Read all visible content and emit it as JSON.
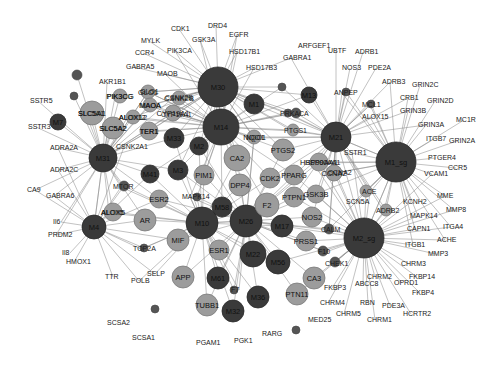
{
  "colors": {
    "module": "#3a3a3a",
    "hub": "#9c9c9c",
    "small": "#555555",
    "edge": "#8a8a8a",
    "background": "#ffffff"
  },
  "nodes": [
    {
      "id": "M30",
      "type": "module",
      "x": 218,
      "y": 87,
      "r": 20
    },
    {
      "id": "M14",
      "type": "module",
      "x": 221,
      "y": 127,
      "r": 18
    },
    {
      "id": "M1",
      "type": "module",
      "x": 254,
      "y": 104,
      "r": 10
    },
    {
      "id": "M13",
      "type": "module",
      "x": 309,
      "y": 95,
      "r": 8
    },
    {
      "id": "M21",
      "type": "module",
      "x": 336,
      "y": 137,
      "r": 15
    },
    {
      "id": "M1_sg",
      "type": "module",
      "x": 396,
      "y": 162,
      "r": 20
    },
    {
      "id": "M2_sg",
      "type": "module",
      "x": 364,
      "y": 238,
      "r": 20
    },
    {
      "id": "M31",
      "type": "module",
      "x": 103,
      "y": 158,
      "r": 14
    },
    {
      "id": "M33",
      "type": "module",
      "x": 174,
      "y": 138,
      "r": 10
    },
    {
      "id": "M2",
      "type": "module",
      "x": 199,
      "y": 146,
      "r": 9
    },
    {
      "id": "M3",
      "type": "module",
      "x": 178,
      "y": 170,
      "r": 10
    },
    {
      "id": "M41",
      "type": "module",
      "x": 150,
      "y": 174,
      "r": 9
    },
    {
      "id": "M10",
      "type": "module",
      "x": 202,
      "y": 223,
      "r": 16
    },
    {
      "id": "M26",
      "type": "module",
      "x": 246,
      "y": 221,
      "r": 16
    },
    {
      "id": "M58",
      "type": "module",
      "x": 222,
      "y": 207,
      "r": 10
    },
    {
      "id": "M17",
      "type": "module",
      "x": 282,
      "y": 226,
      "r": 11
    },
    {
      "id": "M22",
      "type": "module",
      "x": 253,
      "y": 254,
      "r": 13
    },
    {
      "id": "M56",
      "type": "module",
      "x": 278,
      "y": 262,
      "r": 12
    },
    {
      "id": "M61",
      "type": "module",
      "x": 218,
      "y": 278,
      "r": 11
    },
    {
      "id": "M36",
      "type": "module",
      "x": 258,
      "y": 297,
      "r": 11
    },
    {
      "id": "M32",
      "type": "module",
      "x": 233,
      "y": 311,
      "r": 11
    },
    {
      "id": "M4",
      "type": "module",
      "x": 94,
      "y": 227,
      "r": 12
    },
    {
      "id": "M7",
      "type": "module",
      "x": 58,
      "y": 122,
      "r": 8
    },
    {
      "id": "CA2",
      "type": "hub",
      "x": 237,
      "y": 158,
      "r": 13
    },
    {
      "id": "SLC5A1",
      "type": "hub",
      "x": 92,
      "y": 113,
      "r": 12
    },
    {
      "id": "SLC5A2",
      "type": "hub",
      "x": 113,
      "y": 128,
      "r": 11
    },
    {
      "id": "TER1",
      "type": "hub",
      "x": 149,
      "y": 131,
      "r": 9
    },
    {
      "id": "GLO1",
      "type": "hub",
      "x": 148,
      "y": 92,
      "r": 7
    },
    {
      "id": "CSNK2B",
      "type": "hub",
      "x": 179,
      "y": 98,
      "r": 7
    },
    {
      "id": "MAOA",
      "type": "hub",
      "x": 150,
      "y": 105,
      "r": 7
    },
    {
      "id": "CYP19A1",
      "type": "hub",
      "x": 173,
      "y": 113,
      "r": 8
    },
    {
      "id": "ALOX12",
      "type": "hub",
      "x": 133,
      "y": 117,
      "r": 7
    },
    {
      "id": "PIK3CG",
      "type": "hub",
      "x": 120,
      "y": 96,
      "r": 7
    },
    {
      "id": "PIM1",
      "type": "hub",
      "x": 204,
      "y": 175,
      "r": 10
    },
    {
      "id": "DPP4",
      "type": "hub",
      "x": 240,
      "y": 185,
      "r": 11
    },
    {
      "id": "CDK2",
      "type": "hub",
      "x": 270,
      "y": 178,
      "r": 10
    },
    {
      "id": "F2",
      "type": "hub",
      "x": 267,
      "y": 205,
      "r": 12
    },
    {
      "id": "PTGS2",
      "type": "hub",
      "x": 283,
      "y": 150,
      "r": 11
    },
    {
      "id": "PPARG",
      "type": "hub",
      "x": 294,
      "y": 175,
      "r": 10
    },
    {
      "id": "PTPN1",
      "type": "hub",
      "x": 294,
      "y": 197,
      "r": 10
    },
    {
      "id": "GSK3B",
      "type": "hub",
      "x": 316,
      "y": 194,
      "r": 9
    },
    {
      "id": "NOS2",
      "type": "hub",
      "x": 312,
      "y": 217,
      "r": 10
    },
    {
      "id": "PRSS1",
      "type": "hub",
      "x": 306,
      "y": 241,
      "r": 10
    },
    {
      "id": "CA3",
      "type": "hub",
      "x": 314,
      "y": 278,
      "r": 11
    },
    {
      "id": "PTN11",
      "type": "hub",
      "x": 297,
      "y": 294,
      "r": 11
    },
    {
      "id": "ESR1",
      "type": "hub",
      "x": 219,
      "y": 250,
      "r": 10
    },
    {
      "id": "ESR2",
      "type": "hub",
      "x": 159,
      "y": 199,
      "r": 9
    },
    {
      "id": "AR",
      "type": "hub",
      "x": 145,
      "y": 220,
      "r": 11
    },
    {
      "id": "MIF",
      "type": "hub",
      "x": 178,
      "y": 240,
      "r": 11
    },
    {
      "id": "APP",
      "type": "hub",
      "x": 183,
      "y": 277,
      "r": 11
    },
    {
      "id": "TUBB1",
      "type": "hub",
      "x": 207,
      "y": 305,
      "r": 11
    },
    {
      "id": "ALOX5",
      "type": "hub",
      "x": 113,
      "y": 212,
      "r": 9
    },
    {
      "id": "HSP90AA1",
      "type": "hub",
      "x": 319,
      "y": 162,
      "r": 9
    },
    {
      "id": "CCNA2",
      "type": "hub",
      "x": 334,
      "y": 173,
      "r": 8
    },
    {
      "id": "NQO1",
      "type": "hub",
      "x": 254,
      "y": 137,
      "r": 7
    },
    {
      "id": "PTGS1",
      "type": "hub",
      "x": 293,
      "y": 130,
      "r": 6
    },
    {
      "id": "ACE",
      "type": "hub",
      "x": 366,
      "y": 191,
      "r": 6
    },
    {
      "id": "ADRB2",
      "type": "hub",
      "x": 386,
      "y": 210,
      "r": 6
    },
    {
      "id": "CALM",
      "type": "small",
      "x": 329,
      "y": 229,
      "r": 5
    },
    {
      "id": "F10",
      "type": "small",
      "x": 323,
      "y": 251,
      "r": 5
    },
    {
      "id": "F7",
      "type": "small",
      "x": 234,
      "y": 290,
      "r": 4
    },
    {
      "id": "MTOR",
      "type": "small",
      "x": 124,
      "y": 186,
      "r": 5
    },
    {
      "id": "MAPK14",
      "type": "small",
      "x": 197,
      "y": 197,
      "r": 4
    },
    {
      "id": "TOP2A",
      "type": "small",
      "x": 144,
      "y": 248,
      "r": 4
    },
    {
      "id": "CHEK1",
      "type": "small",
      "x": 335,
      "y": 262,
      "r": 5
    },
    {
      "id": "PRKACA",
      "type": "small",
      "x": 296,
      "y": 113,
      "r": 5
    },
    {
      "id": "ANPEP",
      "type": "small",
      "x": 346,
      "y": 92,
      "r": 4
    },
    {
      "id": "MCL1",
      "type": "small",
      "x": 371,
      "y": 104,
      "r": 4
    },
    {
      "id": "M6",
      "type": "small",
      "x": 77,
      "y": 75,
      "r": 5
    },
    {
      "id": "M9",
      "type": "small",
      "x": 74,
      "y": 96,
      "r": 4
    },
    {
      "id": "M50",
      "type": "small",
      "x": 155,
      "y": 309,
      "r": 4
    },
    {
      "id": "M5_sg",
      "type": "small",
      "x": 282,
      "y": 87,
      "r": 4
    },
    {
      "id": "M8_sg",
      "type": "small",
      "x": 296,
      "y": 330,
      "r": 4
    },
    {
      "id": "M34",
      "type": "small",
      "x": 288,
      "y": 113,
      "r": 4
    }
  ],
  "labels": [
    {
      "text": "CDK1",
      "x": 171,
      "y": 31
    },
    {
      "text": "DRD4",
      "x": 208,
      "y": 28
    },
    {
      "text": "EGFR",
      "x": 229,
      "y": 37
    },
    {
      "text": "MYLK",
      "x": 141,
      "y": 43
    },
    {
      "text": "GSK3A",
      "x": 192,
      "y": 42
    },
    {
      "text": "HSD17B1",
      "x": 229,
      "y": 54
    },
    {
      "text": "CCR4",
      "x": 135,
      "y": 55
    },
    {
      "text": "PIK3CA",
      "x": 167,
      "y": 53
    },
    {
      "text": "HSD17B3",
      "x": 246,
      "y": 70
    },
    {
      "text": "GABRA5",
      "x": 126,
      "y": 69
    },
    {
      "text": "MAOB",
      "x": 157,
      "y": 76
    },
    {
      "text": "AKR1B1",
      "x": 99,
      "y": 84
    },
    {
      "text": "PIK3CG",
      "x": 107,
      "y": 99
    },
    {
      "text": "GLO1",
      "x": 140,
      "y": 94
    },
    {
      "text": "CSNK2B",
      "x": 165,
      "y": 100
    },
    {
      "text": "MAOA",
      "x": 140,
      "y": 108
    },
    {
      "text": "CYP19A1",
      "x": 161,
      "y": 117
    },
    {
      "text": "ALOX12",
      "x": 119,
      "y": 120
    },
    {
      "text": "SLC5A1",
      "x": 78,
      "y": 116
    },
    {
      "text": "SLC5A2",
      "x": 100,
      "y": 131
    },
    {
      "text": "TER1",
      "x": 140,
      "y": 134
    },
    {
      "text": "SSTR5",
      "x": 30,
      "y": 103
    },
    {
      "text": "SSTR3",
      "x": 28,
      "y": 129
    },
    {
      "text": "ADRA2A",
      "x": 50,
      "y": 150
    },
    {
      "text": "CSNK2A1",
      "x": 116,
      "y": 149
    },
    {
      "text": "ADRA2C",
      "x": 50,
      "y": 172
    },
    {
      "text": "CA9",
      "x": 27,
      "y": 192
    },
    {
      "text": "GABRA6",
      "x": 46,
      "y": 198
    },
    {
      "text": "MTOR",
      "x": 113,
      "y": 189
    },
    {
      "text": "ALOX5",
      "x": 101,
      "y": 215
    },
    {
      "text": "Il6",
      "x": 53,
      "y": 224
    },
    {
      "text": "PRDM2",
      "x": 48,
      "y": 237
    },
    {
      "text": "Il8",
      "x": 62,
      "y": 255
    },
    {
      "text": "HMOX1",
      "x": 66,
      "y": 264
    },
    {
      "text": "MAPK14",
      "x": 182,
      "y": 199
    },
    {
      "text": "TOP2A",
      "x": 133,
      "y": 251
    },
    {
      "text": "TTR",
      "x": 105,
      "y": 279
    },
    {
      "text": "POLB",
      "x": 131,
      "y": 283
    },
    {
      "text": "SELP",
      "x": 147,
      "y": 276
    },
    {
      "text": "SCSA2",
      "x": 107,
      "y": 325
    },
    {
      "text": "SCSA1",
      "x": 132,
      "y": 340
    },
    {
      "text": "PGAM1",
      "x": 196,
      "y": 345
    },
    {
      "text": "PGK1",
      "x": 234,
      "y": 343
    },
    {
      "text": "RARG",
      "x": 262,
      "y": 336
    },
    {
      "text": "MED25",
      "x": 308,
      "y": 322
    },
    {
      "text": "CHRM4",
      "x": 320,
      "y": 305
    },
    {
      "text": "CHRM5",
      "x": 336,
      "y": 316
    },
    {
      "text": "RBN",
      "x": 360,
      "y": 305
    },
    {
      "text": "PDE3A",
      "x": 382,
      "y": 308
    },
    {
      "text": "CHRM1",
      "x": 367,
      "y": 322
    },
    {
      "text": "HCRTR2",
      "x": 403,
      "y": 316
    },
    {
      "text": "FKBP3",
      "x": 324,
      "y": 290
    },
    {
      "text": "ABCC8",
      "x": 355,
      "y": 286
    },
    {
      "text": "CHRM2",
      "x": 367,
      "y": 279
    },
    {
      "text": "OPRD1",
      "x": 394,
      "y": 285
    },
    {
      "text": "FKBP14",
      "x": 409,
      "y": 279
    },
    {
      "text": "FKBP4",
      "x": 412,
      "y": 295
    },
    {
      "text": "CHRM3",
      "x": 401,
      "y": 266
    },
    {
      "text": "MMP3",
      "x": 428,
      "y": 256
    },
    {
      "text": "ITGB1",
      "x": 405,
      "y": 247
    },
    {
      "text": "ACHE",
      "x": 437,
      "y": 242
    },
    {
      "text": "CAPN1",
      "x": 407,
      "y": 231
    },
    {
      "text": "ITGA4",
      "x": 443,
      "y": 229
    },
    {
      "text": "MAPK14",
      "x": 410,
      "y": 218
    },
    {
      "text": "MMP8",
      "x": 446,
      "y": 212
    },
    {
      "text": "KCNH2",
      "x": 403,
      "y": 204
    },
    {
      "text": "MME",
      "x": 437,
      "y": 198
    },
    {
      "text": "VCAM1",
      "x": 424,
      "y": 176
    },
    {
      "text": "CCR5",
      "x": 448,
      "y": 170
    },
    {
      "text": "PTGER4",
      "x": 428,
      "y": 160
    },
    {
      "text": "ITGB7",
      "x": 426,
      "y": 141
    },
    {
      "text": "GRIN2A",
      "x": 449,
      "y": 143
    },
    {
      "text": "GRIN3A",
      "x": 418,
      "y": 127
    },
    {
      "text": "MC1R",
      "x": 456,
      "y": 122
    },
    {
      "text": "GRIN3B",
      "x": 400,
      "y": 113
    },
    {
      "text": "CRB1",
      "x": 400,
      "y": 100
    },
    {
      "text": "GRIN2D",
      "x": 427,
      "y": 103
    },
    {
      "text": "GRIN2C",
      "x": 412,
      "y": 87
    },
    {
      "text": "ADRB3",
      "x": 382,
      "y": 84
    },
    {
      "text": "ADRB1",
      "x": 355,
      "y": 54
    },
    {
      "text": "PDE2A",
      "x": 368,
      "y": 70
    },
    {
      "text": "NOS3",
      "x": 342,
      "y": 70
    },
    {
      "text": "UBTF",
      "x": 328,
      "y": 53
    },
    {
      "text": "ARFGEF1",
      "x": 298,
      "y": 48
    },
    {
      "text": "GABRA1",
      "x": 283,
      "y": 60
    },
    {
      "text": "ANPEP",
      "x": 334,
      "y": 95
    },
    {
      "text": "MCL1",
      "x": 362,
      "y": 107
    },
    {
      "text": "ALOX15",
      "x": 362,
      "y": 119
    },
    {
      "text": "PRKACA",
      "x": 280,
      "y": 116
    },
    {
      "text": "PTGS1",
      "x": 284,
      "y": 133
    },
    {
      "text": "SSTR1",
      "x": 344,
      "y": 155
    },
    {
      "text": "HSP90AA1",
      "x": 305,
      "y": 165
    },
    {
      "text": "CCNA2",
      "x": 328,
      "y": 175
    },
    {
      "text": "NQO1",
      "x": 246,
      "y": 140
    },
    {
      "text": "ACE",
      "x": 362,
      "y": 194
    },
    {
      "text": "ADRB2",
      "x": 376,
      "y": 213
    },
    {
      "text": "SCN5A",
      "x": 346,
      "y": 204
    },
    {
      "text": "CALM",
      "x": 321,
      "y": 232
    },
    {
      "text": "F10",
      "x": 318,
      "y": 254
    },
    {
      "text": "CHEK1",
      "x": 325,
      "y": 266
    },
    {
      "text": "F7",
      "x": 231,
      "y": 292
    }
  ],
  "edge_hubs": [
    "M30",
    "M14",
    "M1_sg",
    "M2_sg",
    "M10",
    "M26",
    "M31",
    "M21",
    "M4"
  ]
}
